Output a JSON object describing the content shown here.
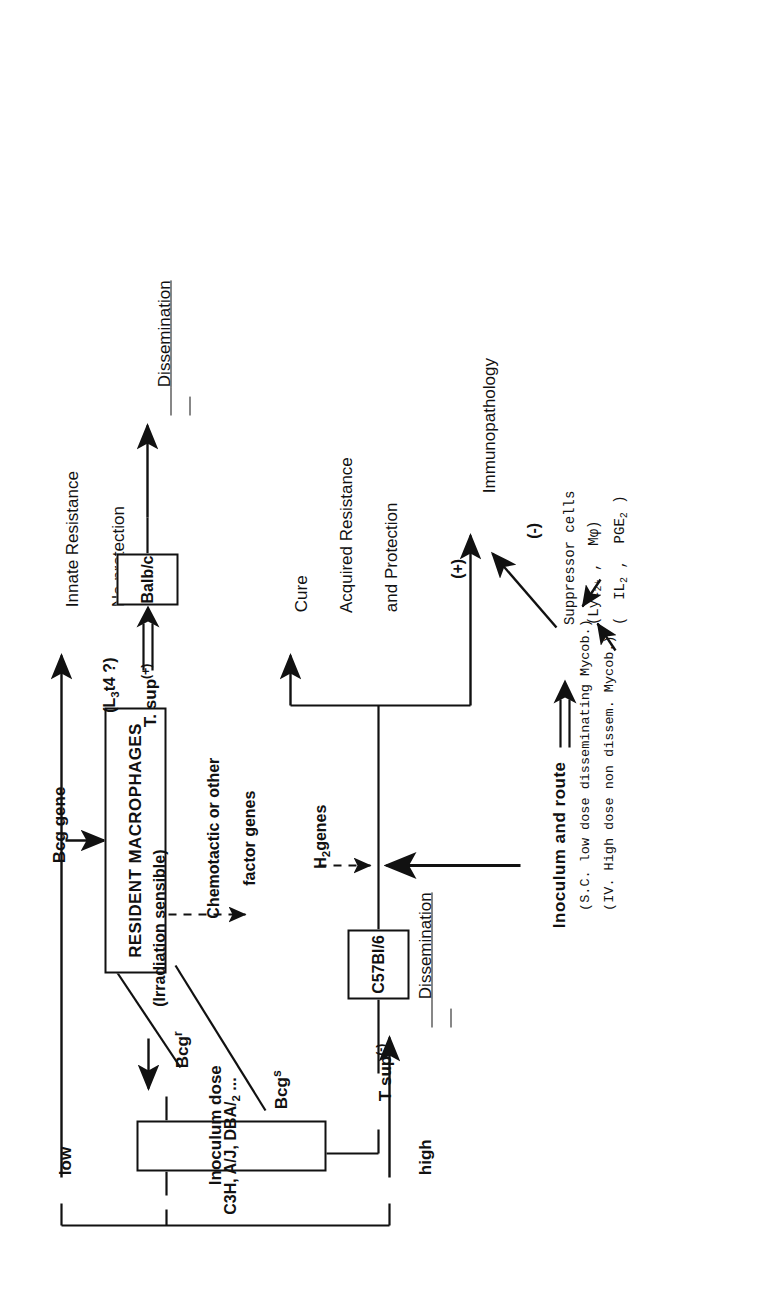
{
  "figure": {
    "type": "flowchart",
    "orientation": "rotated-90-ccw",
    "title_present": false
  },
  "nodes": {
    "bcg_gene": "Bcg gene",
    "resident_macrophages": "RESIDENT MACROPHAGES",
    "chemotactic_note_line1": "Chemotactic or other",
    "chemotactic_note_line2": "factor genes",
    "bcg_r": "Bcg",
    "bcg_r_sup": "r",
    "bcg_s": "Bcg",
    "bcg_s_sup": "s",
    "strains_resistant": "C3H, A/J, DBA/",
    "strains_resistant_sub": "2",
    "strains_resistant_tail": " ...",
    "inoculum_dose": "Inoculum dose",
    "dose_low": "low",
    "dose_high": "high",
    "innate_resistance_line1": "Innate Resistance",
    "innate_resistance_line2": "No protection",
    "dissemination_top": "Dissemination",
    "t_sup_plus": "T. sup",
    "t_sup_plus_sup": "(+)",
    "t_sup_minus": "T sup",
    "t_sup_minus_sup": "(-)",
    "irradiation_sensible": "(Irradiation sensible)",
    "l3t4": "(L",
    "l3t4_sub": "3",
    "l3t4_tail": "t4 ?)",
    "strain_balbc": "Balb/c",
    "strain_c57": "C57Bl/6",
    "dissemination_mid": "Dissemination",
    "h2_genes": "H",
    "h2_genes_sub": "2",
    "h2_genes_tail": "genes",
    "inoculum_and_route": "Inoculum and route",
    "route_note_line1": "(S.C. low dose disseminating Mycob.)",
    "route_note_line2": "(IV. High dose non dissem. Mycob.)",
    "suppressor_cells": "Suppressor cells",
    "suppressor_markers_open": "(Lyt",
    "suppressor_markers_sub": "2+",
    "suppressor_markers_rest": " ,  Mφ)",
    "suppressor_mediators_open": "(  ",
    "suppressor_mediators_il2": "IL",
    "suppressor_mediators_il2_sub": "2",
    "suppressor_mediators_mid": " ,  ",
    "suppressor_mediators_pge": "PGE",
    "suppressor_mediators_pge_sub": "2",
    "suppressor_mediators_close": " )",
    "outcome_cure_line1": "Cure",
    "outcome_cure_line2": "Acquired Resistance",
    "outcome_cure_line3": "and Protection",
    "outcome_immunopathology": "Immunopathology",
    "sign_plus": "(+)",
    "sign_minus": "(-)"
  },
  "colors": {
    "ink": "#111111",
    "paper": "#ffffff"
  }
}
